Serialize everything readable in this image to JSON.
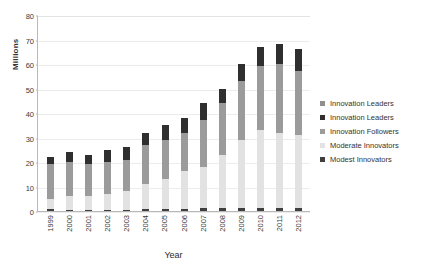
{
  "chart_data": {
    "type": "bar",
    "subtype": "stacked-column",
    "title": "",
    "xlabel": "Year",
    "ylabel": "Millions",
    "ylim": [
      0,
      80
    ],
    "ytick_step": 10,
    "yticks": [
      "80",
      "70",
      "60",
      "50",
      "40",
      "30",
      "20",
      "10",
      "0"
    ],
    "grid": true,
    "legend_position": "right",
    "categories": [
      "1999",
      "2000",
      "2001",
      "2002",
      "2003",
      "2004",
      "2005",
      "2006",
      "2007",
      "2008",
      "2009",
      "2010",
      "2011",
      "2012"
    ],
    "series": [
      {
        "name": "Modest Innovators",
        "color": "#3f3f3f",
        "values": [
          0.8,
          0.5,
          0.5,
          0.4,
          0.4,
          1.0,
          1.0,
          1.0,
          1.1,
          1.2,
          1.3,
          1.2,
          1.2,
          1.2
        ]
      },
      {
        "name": "Moderate Innovators",
        "color": "#e2e2e2",
        "values": [
          4.2,
          5.5,
          5.5,
          6.6,
          7.6,
          10.0,
          12.0,
          15.5,
          16.9,
          21.8,
          27.7,
          31.8,
          30.8,
          29.8
        ]
      },
      {
        "name": "Innovation Followers",
        "color": "#9b9b9b",
        "values": [
          14.0,
          14.0,
          13.0,
          13.0,
          13.0,
          16.0,
          16.0,
          15.5,
          19.0,
          21.0,
          24.0,
          26.0,
          28.0,
          26.0
        ]
      },
      {
        "name": "Innovation Leaders",
        "color": "#2f2f2f",
        "values": [
          3.0,
          4.0,
          4.0,
          5.0,
          5.0,
          5.0,
          6.0,
          6.0,
          7.0,
          6.0,
          7.0,
          8.0,
          8.0,
          9.0
        ]
      }
    ],
    "totals": [
      22,
      24,
      23,
      25,
      26,
      32,
      35,
      38,
      44,
      50,
      60,
      67,
      68,
      66
    ],
    "legend_entries": [
      {
        "label": "Innovation Leaders",
        "color": "#8f8f8f"
      },
      {
        "label": "Innovation Leaders",
        "color": "#2f2f2f"
      },
      {
        "label": "Innovation Followers",
        "color": "#9b9b9b"
      },
      {
        "label": "Moderate Innovators",
        "color": "#e2e2e2"
      },
      {
        "label": "Modest Innovators",
        "color": "#3f3f3f"
      }
    ]
  }
}
